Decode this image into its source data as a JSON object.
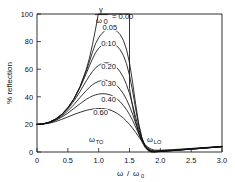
{
  "chart_data": {
    "type": "line",
    "title": "",
    "xlabel": "ω / ω₀",
    "ylabel": "% reflection",
    "xlim": [
      0,
      3.0
    ],
    "ylim": [
      0,
      100
    ],
    "xticks": [
      "0",
      "0.5",
      "1.0",
      "1.5",
      "2.0",
      "2.5",
      "3.0"
    ],
    "xtick_values": [
      0,
      0.5,
      1.0,
      1.5,
      2.0,
      2.5,
      3.0
    ],
    "yticks": [
      "0",
      "20",
      "40",
      "60",
      "80",
      "100"
    ],
    "ytick_values": [
      0,
      20,
      40,
      60,
      80,
      100
    ],
    "grid": false,
    "legend_position": "inside-top-center",
    "legend_title": "γ/ω₀ =",
    "series_parameter_name": "γ/ω₀",
    "annotations": [
      {
        "text": "ω",
        "subscript": "TO",
        "x": 1.0,
        "y": 9
      },
      {
        "text": "ω",
        "subscript": "LO",
        "x": 1.5,
        "y": 9
      }
    ],
    "omega_TO": 1.0,
    "omega_LO": 1.5,
    "series": [
      {
        "name": "0.00",
        "label": "0.00",
        "label_x": 1.72,
        "label_y": 112,
        "points": [
          [
            0.0,
            20.0
          ],
          [
            0.1,
            20.4
          ],
          [
            0.2,
            21.6
          ],
          [
            0.3,
            23.8
          ],
          [
            0.4,
            27.2
          ],
          [
            0.5,
            32.0
          ],
          [
            0.6,
            38.6
          ],
          [
            0.7,
            47.6
          ],
          [
            0.8,
            60.0
          ],
          [
            0.85,
            68.0
          ],
          [
            0.9,
            78.0
          ],
          [
            0.94,
            87.0
          ],
          [
            0.97,
            94.0
          ],
          [
            0.99,
            99.0
          ],
          [
            1.0,
            100.0
          ],
          [
            1.1,
            100.0
          ],
          [
            1.2,
            100.0
          ],
          [
            1.3,
            100.0
          ],
          [
            1.4,
            100.0
          ],
          [
            1.49,
            100.0
          ],
          [
            1.5,
            100.0
          ],
          [
            1.5,
            46.0
          ],
          [
            1.55,
            33.0
          ],
          [
            1.6,
            22.0
          ],
          [
            1.65,
            13.5
          ],
          [
            1.7,
            7.5
          ],
          [
            1.75,
            3.4
          ],
          [
            1.8,
            1.0
          ],
          [
            1.85,
            0.1
          ],
          [
            1.9,
            0.05
          ],
          [
            2.0,
            0.35
          ],
          [
            2.2,
            1.0
          ],
          [
            2.4,
            1.7
          ],
          [
            2.6,
            2.4
          ],
          [
            2.8,
            3.1
          ],
          [
            3.0,
            3.8
          ]
        ]
      },
      {
        "name": "0.05",
        "label": "0.05",
        "label_x": 1.18,
        "label_y": 90.5,
        "points": [
          [
            0.0,
            20.0
          ],
          [
            0.1,
            20.4
          ],
          [
            0.2,
            21.6
          ],
          [
            0.3,
            23.8
          ],
          [
            0.4,
            27.2
          ],
          [
            0.5,
            32.0
          ],
          [
            0.6,
            38.6
          ],
          [
            0.7,
            47.4
          ],
          [
            0.8,
            58.8
          ],
          [
            0.85,
            65.4
          ],
          [
            0.9,
            72.4
          ],
          [
            0.95,
            78.6
          ],
          [
            1.0,
            82.8
          ],
          [
            1.05,
            85.8
          ],
          [
            1.1,
            87.8
          ],
          [
            1.15,
            89.0
          ],
          [
            1.2,
            89.3
          ],
          [
            1.25,
            88.8
          ],
          [
            1.3,
            87.4
          ],
          [
            1.35,
            85.0
          ],
          [
            1.4,
            81.0
          ],
          [
            1.45,
            74.6
          ],
          [
            1.5,
            64.6
          ],
          [
            1.55,
            50.6
          ],
          [
            1.6,
            34.6
          ],
          [
            1.65,
            20.4
          ],
          [
            1.7,
            10.4
          ],
          [
            1.75,
            4.4
          ],
          [
            1.8,
            1.3
          ],
          [
            1.85,
            0.2
          ],
          [
            1.9,
            0.1
          ],
          [
            2.0,
            0.4
          ],
          [
            2.2,
            1.0
          ],
          [
            2.4,
            1.7
          ],
          [
            2.6,
            2.4
          ],
          [
            2.8,
            3.1
          ],
          [
            3.0,
            3.8
          ]
        ]
      },
      {
        "name": "0.10",
        "label": "0.10",
        "label_x": 1.16,
        "label_y": 79.0,
        "points": [
          [
            0.0,
            20.0
          ],
          [
            0.1,
            20.4
          ],
          [
            0.2,
            21.6
          ],
          [
            0.3,
            23.8
          ],
          [
            0.4,
            27.2
          ],
          [
            0.5,
            32.0
          ],
          [
            0.6,
            38.4
          ],
          [
            0.7,
            46.8
          ],
          [
            0.8,
            57.0
          ],
          [
            0.85,
            62.4
          ],
          [
            0.9,
            67.6
          ],
          [
            0.95,
            72.0
          ],
          [
            1.0,
            75.2
          ],
          [
            1.05,
            77.4
          ],
          [
            1.1,
            78.6
          ],
          [
            1.15,
            79.2
          ],
          [
            1.2,
            79.0
          ],
          [
            1.25,
            78.2
          ],
          [
            1.3,
            76.6
          ],
          [
            1.35,
            74.0
          ],
          [
            1.4,
            70.0
          ],
          [
            1.45,
            64.2
          ],
          [
            1.5,
            55.6
          ],
          [
            1.55,
            44.2
          ],
          [
            1.6,
            31.2
          ],
          [
            1.65,
            19.2
          ],
          [
            1.7,
            10.2
          ],
          [
            1.75,
            4.6
          ],
          [
            1.8,
            1.5
          ],
          [
            1.85,
            0.3
          ],
          [
            1.9,
            0.15
          ],
          [
            2.0,
            0.45
          ],
          [
            2.2,
            1.05
          ],
          [
            2.4,
            1.75
          ],
          [
            2.6,
            2.45
          ],
          [
            2.8,
            3.15
          ],
          [
            3.0,
            3.85
          ]
        ]
      },
      {
        "name": "0.20",
        "label": "0.20",
        "label_x": 1.16,
        "label_y": 62.0,
        "points": [
          [
            0.0,
            20.0
          ],
          [
            0.1,
            20.4
          ],
          [
            0.2,
            21.6
          ],
          [
            0.3,
            23.6
          ],
          [
            0.4,
            26.8
          ],
          [
            0.5,
            31.2
          ],
          [
            0.6,
            37.0
          ],
          [
            0.7,
            44.0
          ],
          [
            0.8,
            51.6
          ],
          [
            0.85,
            55.2
          ],
          [
            0.9,
            58.4
          ],
          [
            0.95,
            61.0
          ],
          [
            1.0,
            62.8
          ],
          [
            1.05,
            64.0
          ],
          [
            1.1,
            64.6
          ],
          [
            1.15,
            64.6
          ],
          [
            1.2,
            64.0
          ],
          [
            1.25,
            62.8
          ],
          [
            1.3,
            60.8
          ],
          [
            1.35,
            58.0
          ],
          [
            1.4,
            54.2
          ],
          [
            1.45,
            49.0
          ],
          [
            1.5,
            42.4
          ],
          [
            1.55,
            34.2
          ],
          [
            1.6,
            25.2
          ],
          [
            1.65,
            16.6
          ],
          [
            1.7,
            9.6
          ],
          [
            1.75,
            4.8
          ],
          [
            1.8,
            1.9
          ],
          [
            1.85,
            0.6
          ],
          [
            1.9,
            0.3
          ],
          [
            2.0,
            0.55
          ],
          [
            2.2,
            1.15
          ],
          [
            2.4,
            1.85
          ],
          [
            2.6,
            2.5
          ],
          [
            2.8,
            3.2
          ],
          [
            3.0,
            3.9
          ]
        ]
      },
      {
        "name": "0.30",
        "label": "0.30",
        "label_x": 1.16,
        "label_y": 49.5,
        "points": [
          [
            0.0,
            20.0
          ],
          [
            0.1,
            20.3
          ],
          [
            0.2,
            21.4
          ],
          [
            0.3,
            23.2
          ],
          [
            0.4,
            26.0
          ],
          [
            0.5,
            29.8
          ],
          [
            0.6,
            34.4
          ],
          [
            0.7,
            39.6
          ],
          [
            0.8,
            44.6
          ],
          [
            0.85,
            46.8
          ],
          [
            0.9,
            48.8
          ],
          [
            0.95,
            50.2
          ],
          [
            1.0,
            51.2
          ],
          [
            1.05,
            51.8
          ],
          [
            1.1,
            52.0
          ],
          [
            1.15,
            51.8
          ],
          [
            1.2,
            51.0
          ],
          [
            1.25,
            49.8
          ],
          [
            1.3,
            48.0
          ],
          [
            1.35,
            45.4
          ],
          [
            1.4,
            42.2
          ],
          [
            1.45,
            38.2
          ],
          [
            1.5,
            33.2
          ],
          [
            1.55,
            27.4
          ],
          [
            1.6,
            21.0
          ],
          [
            1.65,
            14.6
          ],
          [
            1.7,
            8.8
          ],
          [
            1.75,
            4.8
          ],
          [
            1.8,
            2.2
          ],
          [
            1.85,
            0.9
          ],
          [
            1.9,
            0.5
          ],
          [
            2.0,
            0.7
          ],
          [
            2.2,
            1.25
          ],
          [
            2.4,
            1.9
          ],
          [
            2.6,
            2.6
          ],
          [
            2.8,
            3.25
          ],
          [
            3.0,
            3.95
          ]
        ]
      },
      {
        "name": "0.40",
        "label": "0.40",
        "label_x": 1.16,
        "label_y": 38.0,
        "points": [
          [
            0.0,
            20.0
          ],
          [
            0.1,
            20.3
          ],
          [
            0.2,
            21.2
          ],
          [
            0.3,
            22.8
          ],
          [
            0.4,
            25.2
          ],
          [
            0.5,
            28.2
          ],
          [
            0.6,
            31.6
          ],
          [
            0.7,
            35.0
          ],
          [
            0.8,
            38.2
          ],
          [
            0.85,
            39.5
          ],
          [
            0.9,
            40.6
          ],
          [
            0.95,
            41.4
          ],
          [
            1.0,
            42.0
          ],
          [
            1.05,
            42.2
          ],
          [
            1.1,
            42.2
          ],
          [
            1.15,
            41.8
          ],
          [
            1.2,
            41.2
          ],
          [
            1.25,
            40.0
          ],
          [
            1.3,
            38.4
          ],
          [
            1.35,
            36.4
          ],
          [
            1.4,
            33.8
          ],
          [
            1.45,
            30.8
          ],
          [
            1.5,
            27.2
          ],
          [
            1.55,
            23.0
          ],
          [
            1.6,
            18.2
          ],
          [
            1.65,
            13.2
          ],
          [
            1.7,
            8.6
          ],
          [
            1.75,
            5.0
          ],
          [
            1.8,
            2.6
          ],
          [
            1.85,
            1.3
          ],
          [
            1.9,
            0.8
          ],
          [
            2.0,
            0.95
          ],
          [
            2.2,
            1.4
          ],
          [
            2.4,
            2.05
          ],
          [
            2.6,
            2.7
          ],
          [
            2.8,
            3.35
          ],
          [
            3.0,
            4.0
          ]
        ]
      },
      {
        "name": "0.60",
        "label": "0.60",
        "label_x": 1.03,
        "label_y": 28.5,
        "points": [
          [
            0.0,
            20.0
          ],
          [
            0.1,
            20.2
          ],
          [
            0.2,
            20.9
          ],
          [
            0.3,
            22.0
          ],
          [
            0.4,
            23.6
          ],
          [
            0.5,
            25.4
          ],
          [
            0.6,
            27.2
          ],
          [
            0.7,
            28.8
          ],
          [
            0.8,
            30.2
          ],
          [
            0.85,
            30.7
          ],
          [
            0.9,
            31.1
          ],
          [
            0.95,
            31.4
          ],
          [
            1.0,
            31.5
          ],
          [
            1.05,
            31.5
          ],
          [
            1.1,
            31.3
          ],
          [
            1.15,
            30.9
          ],
          [
            1.2,
            30.2
          ],
          [
            1.25,
            29.2
          ],
          [
            1.3,
            28.0
          ],
          [
            1.35,
            26.4
          ],
          [
            1.4,
            24.6
          ],
          [
            1.45,
            22.4
          ],
          [
            1.5,
            20.0
          ],
          [
            1.55,
            17.2
          ],
          [
            1.6,
            14.2
          ],
          [
            1.65,
            11.0
          ],
          [
            1.7,
            8.0
          ],
          [
            1.75,
            5.4
          ],
          [
            1.8,
            3.4
          ],
          [
            1.85,
            2.1
          ],
          [
            1.9,
            1.4
          ],
          [
            2.0,
            1.3
          ],
          [
            2.2,
            1.7
          ],
          [
            2.4,
            2.3
          ],
          [
            2.6,
            2.9
          ],
          [
            2.8,
            3.5
          ],
          [
            3.0,
            4.1
          ]
        ]
      }
    ]
  },
  "legend": {
    "numerator": "γ",
    "denominator": "ω",
    "denominator_sub": "0",
    "equals": "= 0.00"
  },
  "axes": {
    "ylabel": "% reflection",
    "xlabel_num": "ω",
    "xlabel_sep": "/",
    "xlabel_den": "ω",
    "xlabel_den_sub": "0"
  },
  "annotations": {
    "omega_to": "ω",
    "omega_to_sub": "TO",
    "omega_lo": "ω",
    "omega_lo_sub": "LO"
  },
  "colors": {
    "background": "#ffffff",
    "ink": "#111111",
    "axis": "#1a1a1a"
  }
}
